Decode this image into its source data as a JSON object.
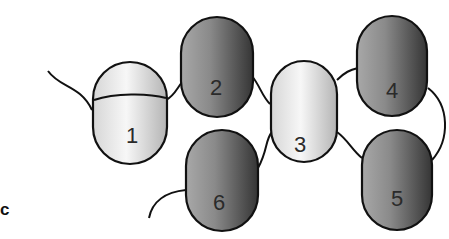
{
  "figure": {
    "panel_label": "c",
    "domains": [
      {
        "id": "1",
        "label": "1",
        "shade": "light"
      },
      {
        "id": "2",
        "label": "2",
        "shade": "dark"
      },
      {
        "id": "3",
        "label": "3",
        "shade": "light"
      },
      {
        "id": "4",
        "label": "4",
        "shade": "dark"
      },
      {
        "id": "5",
        "label": "5",
        "shade": "dark"
      },
      {
        "id": "6",
        "label": "6",
        "shade": "dark"
      }
    ],
    "colors": {
      "light_center": "#f4f4f4",
      "light_edge": "#b8b8b8",
      "dark_center": "#9a9a9a",
      "dark_edge": "#3a3a3a",
      "outline": "#111111"
    }
  }
}
